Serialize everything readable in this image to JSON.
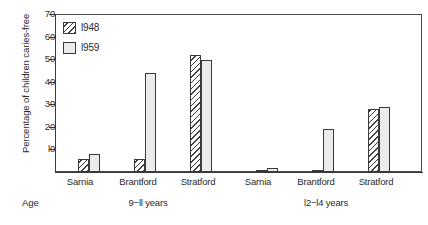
{
  "chart_data": {
    "type": "bar",
    "title": "",
    "xlabel": "Age",
    "ylabel": "Percentage of children caries-free",
    "ylim": [
      0,
      70
    ],
    "yticks": [
      0,
      10,
      20,
      30,
      40,
      50,
      60,
      70
    ],
    "ytick_labels": [
      "",
      "10",
      "20",
      "30",
      "40",
      "50",
      "60",
      "70"
    ],
    "grid": false,
    "legend_position": "top-left",
    "categories": [
      "Sarnia",
      "Brantford",
      "Stratford",
      "Sarnia",
      "Brantford",
      "Stratford"
    ],
    "groups": [
      {
        "label": "9-11 years",
        "categories": [
          "Sarnia",
          "Brantford",
          "Stratford"
        ],
        "series": [
          {
            "name": "1948",
            "values": [
              6,
              6,
              52
            ]
          },
          {
            "name": "1959",
            "values": [
              8,
              44,
              50
            ]
          }
        ]
      },
      {
        "label": "12-14 years",
        "categories": [
          "Sarnia",
          "Brantford",
          "Stratford"
        ],
        "series": [
          {
            "name": "1948",
            "values": [
              1,
              1,
              28
            ]
          },
          {
            "name": "1959",
            "values": [
              2,
              19,
              29
            ]
          }
        ]
      }
    ],
    "series": [
      {
        "name": "1948",
        "values": [
          6,
          6,
          52,
          1,
          1,
          28
        ]
      },
      {
        "name": "1959",
        "values": [
          8,
          44,
          50,
          2,
          19,
          29
        ]
      }
    ]
  },
  "axis": {
    "y_title": "Percentage of children caries-free",
    "ticks": [
      {
        "value": 70,
        "label": "70"
      },
      {
        "value": 60,
        "label": "60"
      },
      {
        "value": 50,
        "label": "50"
      },
      {
        "value": 40,
        "label": "40"
      },
      {
        "value": 30,
        "label": "30"
      },
      {
        "value": 20,
        "label": "20"
      },
      {
        "value": 10,
        "label": "l0"
      }
    ]
  },
  "legend": {
    "items": [
      {
        "label": "l948",
        "pattern": "diagonal-hatch"
      },
      {
        "label": "l959",
        "pattern": "stipple-dots"
      }
    ]
  },
  "labels": {
    "age": "Age",
    "group_1": "9−ll years",
    "group_2": "l2−l4 years",
    "cat_sarnia_1": "Sarnia",
    "cat_brantford_1": "Brantford",
    "cat_stratford_1": "Stratford",
    "cat_sarnia_2": "Sarnia",
    "cat_brantford_2": "Brantford",
    "cat_stratford_2": "Stratford"
  },
  "colors": {
    "axis": "#3a3a3a",
    "text": "#2b2b2b",
    "bar_1948_fill": "#fdfdfd",
    "bar_1959_fill": "#ebebeb",
    "background": "#ffffff"
  }
}
